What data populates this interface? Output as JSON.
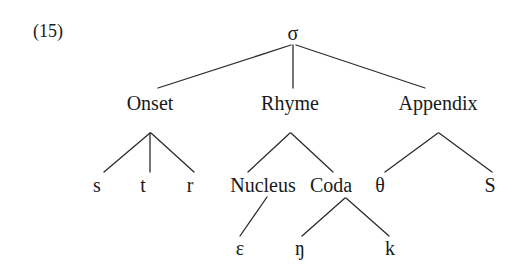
{
  "figure": {
    "example_number": "(15)",
    "example_number_x": 33,
    "example_number_y": 22,
    "width": 519,
    "height": 273,
    "background_color": "#ffffff",
    "ink_color": "#1a1a1a",
    "edge_color": "#2b2b2b",
    "edge_width": 1.3
  },
  "nodes": [
    {
      "id": "sigma",
      "label": "σ",
      "x": 293,
      "y": 33,
      "level": 0,
      "role": "syllable-root",
      "class": "node-root"
    },
    {
      "id": "onset",
      "label": "Onset",
      "x": 150,
      "y": 103,
      "level": 1,
      "role": "constituent",
      "class": "node-constituent"
    },
    {
      "id": "rhyme",
      "label": "Rhyme",
      "x": 290,
      "y": 103,
      "level": 1,
      "role": "constituent",
      "class": "node-constituent"
    },
    {
      "id": "appendix",
      "label": "Appendix",
      "x": 438,
      "y": 103,
      "level": 1,
      "role": "constituent",
      "class": "node-constituent"
    },
    {
      "id": "s",
      "label": "s",
      "x": 97,
      "y": 185,
      "level": 2,
      "role": "segment",
      "class": "node-segment"
    },
    {
      "id": "t",
      "label": "t",
      "x": 143,
      "y": 185,
      "level": 2,
      "role": "segment",
      "class": "node-segment"
    },
    {
      "id": "r",
      "label": "r",
      "x": 190,
      "y": 185,
      "level": 2,
      "role": "segment",
      "class": "node-segment"
    },
    {
      "id": "nucleus",
      "label": "Nucleus",
      "x": 263,
      "y": 185,
      "level": 2,
      "role": "constituent",
      "class": "node-constituent"
    },
    {
      "id": "coda",
      "label": "Coda",
      "x": 331,
      "y": 185,
      "level": 2,
      "role": "constituent",
      "class": "node-constituent"
    },
    {
      "id": "theta",
      "label": "θ",
      "x": 380,
      "y": 185,
      "level": 2,
      "role": "segment",
      "class": "node-segment"
    },
    {
      "id": "S",
      "label": "S",
      "x": 490,
      "y": 185,
      "level": 2,
      "role": "segment",
      "class": "node-segment"
    },
    {
      "id": "epsilon",
      "label": "ɛ",
      "x": 240,
      "y": 248,
      "level": 3,
      "role": "segment",
      "class": "node-segment"
    },
    {
      "id": "eng",
      "label": "ŋ",
      "x": 300,
      "y": 248,
      "level": 3,
      "role": "segment",
      "class": "node-segment"
    },
    {
      "id": "k",
      "label": "k",
      "x": 390,
      "y": 248,
      "level": 3,
      "role": "segment",
      "class": "node-segment"
    }
  ],
  "edges": [
    {
      "id": "sigma-onset",
      "from": "sigma",
      "to": "onset",
      "x1": 291,
      "y1": 45,
      "x2": 158,
      "y2": 88
    },
    {
      "id": "sigma-rhyme",
      "from": "sigma",
      "to": "rhyme",
      "x1": 293,
      "y1": 45,
      "x2": 293,
      "y2": 88
    },
    {
      "id": "sigma-appendix",
      "from": "sigma",
      "to": "appendix",
      "x1": 296,
      "y1": 45,
      "x2": 425,
      "y2": 88
    },
    {
      "id": "onset-s",
      "from": "onset",
      "to": "s",
      "x1": 150,
      "y1": 133,
      "x2": 104,
      "y2": 172
    },
    {
      "id": "onset-t",
      "from": "onset",
      "to": "t",
      "x1": 150,
      "y1": 133,
      "x2": 150,
      "y2": 172
    },
    {
      "id": "onset-r",
      "from": "onset",
      "to": "r",
      "x1": 151,
      "y1": 133,
      "x2": 194,
      "y2": 172
    },
    {
      "id": "rhyme-nucleus",
      "from": "rhyme",
      "to": "nucleus",
      "x1": 290,
      "y1": 133,
      "x2": 248,
      "y2": 172
    },
    {
      "id": "rhyme-coda",
      "from": "rhyme",
      "to": "coda",
      "x1": 291,
      "y1": 133,
      "x2": 333,
      "y2": 172
    },
    {
      "id": "appendix-theta",
      "from": "appendix",
      "to": "theta",
      "x1": 438,
      "y1": 133,
      "x2": 385,
      "y2": 172
    },
    {
      "id": "appendix-S",
      "from": "appendix",
      "to": "S",
      "x1": 439,
      "y1": 133,
      "x2": 492,
      "y2": 172
    },
    {
      "id": "nucleus-epsilon",
      "from": "nucleus",
      "to": "epsilon",
      "x1": 267,
      "y1": 197,
      "x2": 240,
      "y2": 236
    },
    {
      "id": "coda-eng",
      "from": "coda",
      "to": "eng",
      "x1": 345,
      "y1": 198,
      "x2": 302,
      "y2": 236
    },
    {
      "id": "coda-k",
      "from": "coda",
      "to": "k",
      "x1": 346,
      "y1": 198,
      "x2": 389,
      "y2": 236
    }
  ]
}
